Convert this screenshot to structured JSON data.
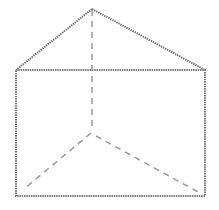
{
  "diagram": {
    "type": "triangular-prism",
    "colors": {
      "background": "#ffffff",
      "solid_edge": "#7a7a7a",
      "hidden_edge": "#9a9a9a"
    },
    "vertices": {
      "apex": [
        92,
        9
      ],
      "top_left": [
        16,
        70
      ],
      "top_right": [
        205,
        70
      ],
      "bottom_left": [
        16,
        196
      ],
      "bottom_right": [
        205,
        196
      ],
      "hidden_back": [
        92,
        133
      ]
    }
  }
}
